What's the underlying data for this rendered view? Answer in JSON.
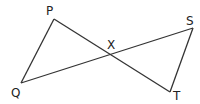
{
  "diagram": {
    "points": {
      "P": {
        "label": "P",
        "x": 54,
        "y": 19
      },
      "Q": {
        "label": "Q",
        "x": 21,
        "y": 83
      },
      "S": {
        "label": "S",
        "x": 193,
        "y": 28
      },
      "T": {
        "label": "T",
        "x": 170,
        "y": 92
      },
      "X": {
        "label": "X",
        "x": 111,
        "y": 56
      }
    },
    "segments": [
      [
        "P",
        "Q"
      ],
      [
        "P",
        "T"
      ],
      [
        "Q",
        "S"
      ],
      [
        "S",
        "T"
      ]
    ],
    "colors": {
      "line": "#333333",
      "background": "#ffffff"
    }
  }
}
